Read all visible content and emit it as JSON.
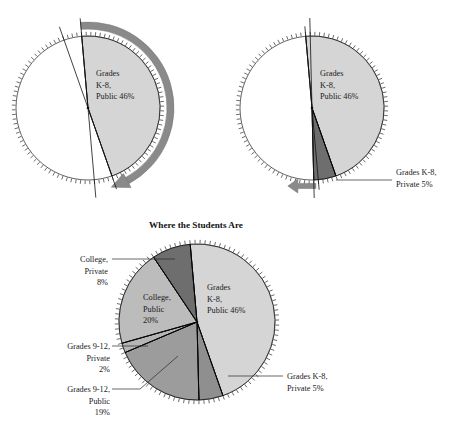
{
  "figure": {
    "title": "Where the Students Are",
    "width": 457,
    "height": 432,
    "background": "#ffffff"
  },
  "palette": {
    "k8_public": "#d5d5d5",
    "k8_private": "#8f8f8f",
    "g912_public": "#9c9c9c",
    "g912_private": "#b5b5b5",
    "college_public": "#bcbcbc",
    "college_private": "#6e6e6e",
    "empty": "#ffffff",
    "outline": "#000000",
    "tick": "#3b3b3b",
    "arrow": "#8a8a8a",
    "text": "#1a1a1a"
  },
  "chart_data": [
    {
      "id": "step1",
      "type": "pie",
      "title": "",
      "note": "first slice drawn, sweep arrow showing 46% measured clockwise",
      "center": [
        88,
        108
      ],
      "radius": 72,
      "tick_count": 100,
      "start_angle_deg": -5,
      "categories": [
        "Grades K-8, Public",
        "(unplotted remainder)"
      ],
      "values": [
        46,
        54
      ],
      "colors": [
        "#d5d5d5",
        "#ffffff"
      ],
      "slice_labels": [
        {
          "lines": [
            "Grades",
            "K-8,",
            "Public 46%"
          ],
          "x": 96,
          "y": 76
        }
      ],
      "annotation": {
        "kind": "sweep-arrow",
        "direction": "clockwise",
        "from_deg": -5,
        "to_deg": 160.6
      }
    },
    {
      "id": "step2",
      "type": "pie",
      "title": "",
      "note": "second slice added, straight arrow marking the 51% boundary",
      "center": [
        312,
        108
      ],
      "radius": 72,
      "tick_count": 100,
      "start_angle_deg": -5,
      "categories": [
        "Grades K-8, Public",
        "Grades K-8, Private",
        "(unplotted remainder)"
      ],
      "values": [
        46,
        5,
        49
      ],
      "colors": [
        "#d5d5d5",
        "#6e6e6e",
        "#ffffff"
      ],
      "slice_labels": [
        {
          "lines": [
            "Grades",
            "K-8,",
            "Public 46%"
          ],
          "x": 320,
          "y": 76
        }
      ],
      "callouts": [
        {
          "lines": [
            "Grades K-8,",
            "Private 5%"
          ],
          "x": 396,
          "y": 175,
          "anchor": "start",
          "leader": [
            [
              336,
              180
            ],
            [
              392,
              180
            ]
          ]
        }
      ],
      "annotation": {
        "kind": "straight-arrow",
        "direction": "left",
        "at_deg": 178.6
      }
    },
    {
      "id": "final",
      "type": "pie",
      "title": "Where the Students Are",
      "title_pos": [
        196,
        228
      ],
      "center": [
        197,
        322
      ],
      "radius": 78,
      "tick_count": 100,
      "start_angle_deg": -5,
      "categories": [
        "Grades K-8, Public",
        "Grades K-8, Private",
        "Grades 9-12, Public",
        "Grades 9-12, Private",
        "College, Public",
        "College, Private"
      ],
      "values": [
        46,
        5,
        19,
        2,
        20,
        8
      ],
      "colors": [
        "#d5d5d5",
        "#8f8f8f",
        "#9c9c9c",
        "#b5b5b5",
        "#bcbcbc",
        "#6e6e6e"
      ],
      "unit": "%",
      "slice_labels": [
        {
          "lines": [
            "Grades",
            "K-8,",
            "Public 46%"
          ],
          "x": 207,
          "y": 290
        },
        {
          "lines": [
            "College,",
            "Public",
            "20%"
          ],
          "x": 143,
          "y": 300
        }
      ],
      "callouts": [
        {
          "lines": [
            "College,",
            "Private",
            "8%"
          ],
          "x": 108,
          "y": 262,
          "anchor": "end",
          "leader": [
            [
              112,
              259
            ],
            [
              175,
              259
            ]
          ]
        },
        {
          "lines": [
            "Grades 9-12,",
            "Private",
            "2%"
          ],
          "x": 110,
          "y": 349,
          "anchor": "end",
          "leader": [
            [
              112,
              346
            ],
            [
              148,
              346
            ]
          ]
        },
        {
          "lines": [
            "Grades 9-12,",
            "Public",
            "19%"
          ],
          "x": 110,
          "y": 392,
          "anchor": "end",
          "leader": [
            [
              112,
              389
            ],
            [
              140,
              389
            ],
            [
              178,
              356
            ]
          ]
        },
        {
          "lines": [
            "Grades K-8,",
            "Private 5%"
          ],
          "x": 287,
          "y": 379,
          "anchor": "start",
          "leader": [
            [
              228,
              376
            ],
            [
              283,
              376
            ]
          ]
        }
      ]
    }
  ]
}
